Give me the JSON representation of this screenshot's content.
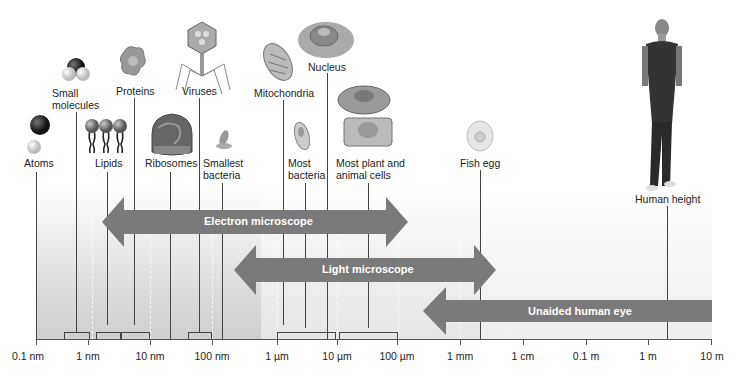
{
  "diagram": {
    "type": "logarithmic size scale",
    "axis": {
      "tick_labels": [
        "0.1 nm",
        "1 nm",
        "10 nm",
        "100 nm",
        "1 µm",
        "10 µm",
        "100 µm",
        "1 mm",
        "1 cm",
        "0.1 m",
        "1 m",
        "10 m"
      ]
    },
    "items": [
      {
        "label": "Atoms",
        "icon": "atom-spheres-icon"
      },
      {
        "label": "Small molecules",
        "icon": "molecule-icon"
      },
      {
        "label": "Lipids",
        "icon": "lipid-icon"
      },
      {
        "label": "Proteins",
        "icon": "protein-icon"
      },
      {
        "label": "Ribosomes",
        "icon": "ribosome-icon"
      },
      {
        "label": "Viruses",
        "icon": "bacteriophage-icon"
      },
      {
        "label": "Smallest bacteria",
        "icon": "small-bacterium-icon"
      },
      {
        "label": "Mitochondria",
        "icon": "mitochondrion-icon"
      },
      {
        "label": "Most bacteria",
        "icon": "bacterium-icon"
      },
      {
        "label": "Nucleus",
        "icon": "nucleus-icon"
      },
      {
        "label": "Most plant and animal cells",
        "icon": "cells-icon"
      },
      {
        "label": "Fish egg",
        "icon": "fish-egg-icon"
      },
      {
        "label": "Human height",
        "icon": "human-figure-icon"
      }
    ],
    "labels": {
      "atoms": "Atoms",
      "small_molecules_1": "Small",
      "small_molecules_2": "molecules",
      "lipids": "Lipids",
      "proteins": "Proteins",
      "ribosomes": "Ribosomes",
      "viruses": "Viruses",
      "smallest_bacteria_1": "Smallest",
      "smallest_bacteria_2": "bacteria",
      "mitochondria": "Mitochondria",
      "most_bacteria_1": "Most",
      "most_bacteria_2": "bacteria",
      "nucleus": "Nucleus",
      "cells_1": "Most plant and",
      "cells_2": "animal cells",
      "fish_egg": "Fish egg",
      "human_height": "Human height"
    },
    "ranges": [
      {
        "label": "Electron microscope",
        "from": "0.1 nm (arrow tip ~1 nm)",
        "to": "~100 µm"
      },
      {
        "label": "Light microscope",
        "from": "~200 nm",
        "to": "~1 mm+"
      },
      {
        "label": "Unaided human eye",
        "from": "~100 µm",
        "to": "10 m"
      }
    ],
    "colors": {
      "arrow": "#7a7a7a",
      "arrow_text": "#ffffff",
      "background_left": "#d8d8d8",
      "background_right": "#f2f2f2",
      "line": "#444444"
    }
  }
}
